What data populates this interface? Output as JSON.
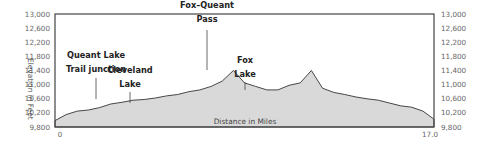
{
  "chart_data": {
    "type": "area",
    "title": "",
    "xlabel": "Distance in Miles",
    "ylabel": "Elevation in Feet",
    "xlim": [
      0,
      17.0
    ],
    "ylim": [
      9800,
      13000
    ],
    "x_ticks": [
      "0",
      "17.0"
    ],
    "y_ticks": [
      "13,000",
      "12,600",
      "12,200",
      "11,800",
      "11,400",
      "11,000",
      "10,600",
      "10,200",
      "9,800"
    ],
    "grid": false,
    "legend": "none",
    "fill_color": "#d9d9d9",
    "line_color": "#333333",
    "x": [
      0,
      0.5,
      1.0,
      1.5,
      2.0,
      2.5,
      3.0,
      3.5,
      4.0,
      4.5,
      5.0,
      5.5,
      6.0,
      6.5,
      7.0,
      7.5,
      8.0,
      8.5,
      9.0,
      9.5,
      10.0,
      10.5,
      11.0,
      11.5,
      12.0,
      12.5,
      13.0,
      13.5,
      14.0,
      14.5,
      15.0,
      15.5,
      16.0,
      16.5,
      17.0
    ],
    "values": [
      9980,
      10150,
      10250,
      10280,
      10350,
      10450,
      10500,
      10560,
      10580,
      10620,
      10680,
      10720,
      10800,
      10850,
      10950,
      11100,
      11400,
      11050,
      10950,
      10850,
      10850,
      10980,
      11050,
      11400,
      10900,
      10780,
      10720,
      10650,
      10600,
      10560,
      10480,
      10400,
      10360,
      10250,
      10020
    ],
    "annotations": [
      {
        "text": [
          "Queant Lake",
          "Trail junction"
        ],
        "x": 3.1,
        "elevation": 10350
      },
      {
        "text": [
          "Cleveland",
          "Lake"
        ],
        "x": 6.9,
        "elevation": 10620
      },
      {
        "text": [
          "Fox–Queant",
          "Pass"
        ],
        "x": 6.9,
        "elevation": 11400
      },
      {
        "text": [
          "Fox",
          "Lake"
        ],
        "x": 8.4,
        "elevation": 10850
      }
    ]
  }
}
